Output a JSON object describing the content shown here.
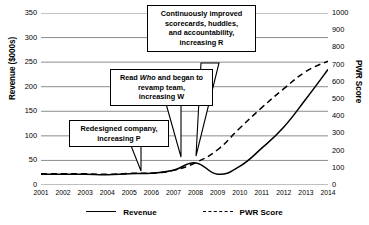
{
  "chart_data": {
    "type": "line",
    "title": "",
    "xlabel": "",
    "ylabel": "Revenue ($000s)",
    "y2label": "PWR Score",
    "grid": true,
    "legend_position": "bottom",
    "categories": [
      2001,
      2002,
      2003,
      2004,
      2005,
      2006,
      2007,
      2008,
      2009,
      2010,
      2011,
      2012,
      2013,
      2014
    ],
    "x_tick_labels": [
      "2001",
      "2002",
      "2003",
      "2004",
      "2005",
      "2006",
      "2007",
      "2008",
      "2009",
      "2010",
      "2011",
      "2012",
      "2013",
      "2014"
    ],
    "ylim": [
      0,
      350
    ],
    "y_tick_labels": [
      "350",
      "300",
      "250",
      "200",
      "150",
      "100",
      "50",
      "0"
    ],
    "y_ticks": [
      350,
      300,
      250,
      200,
      150,
      100,
      50,
      0
    ],
    "y2lim": [
      0,
      1000
    ],
    "y2_tick_labels": [
      "1000",
      "900",
      "800",
      "700",
      "600",
      "500",
      "400",
      "300",
      "200",
      "100",
      "0"
    ],
    "y2_ticks": [
      1000,
      900,
      800,
      700,
      600,
      500,
      400,
      300,
      200,
      100,
      0
    ],
    "series": [
      {
        "name": "Revenue",
        "axis": "left",
        "style": "solid",
        "color": "#000000",
        "values": [
          22,
          22,
          22,
          21,
          23,
          24,
          30,
          45,
          22,
          38,
          75,
          118,
          175,
          235
        ]
      },
      {
        "name": "PWR Score",
        "axis": "right",
        "style": "dashed",
        "color": "#000000",
        "values": [
          65,
          66,
          65,
          62,
          68,
          70,
          85,
          130,
          205,
          330,
          450,
          560,
          660,
          720
        ]
      }
    ],
    "annotations": [
      {
        "id": "increasing-r",
        "text": "Continuously improved scorecards, huddles, and accountability, increasing R",
        "lines": [
          "Continuously improved",
          "scorecards, huddles,",
          "and accountability,",
          "increasing R"
        ],
        "points_to_year": 2010
      },
      {
        "id": "increasing-w",
        "text": "Read Who and began to revamp team, increasing W",
        "lines": [
          "Read Who and began to",
          "revamp team,",
          "increasing W"
        ],
        "italic_word": "Who",
        "points_to_year": 2009
      },
      {
        "id": "increasing-p",
        "text": "Redesigned company, increasing P",
        "lines": [
          "Redesigned company,",
          "increasing P"
        ],
        "points_to_year": 2007
      }
    ]
  },
  "axes": {
    "left_title": "Revenue ($000s)",
    "right_title": "PWR Score"
  },
  "legend": {
    "entries": [
      {
        "label": "Revenue",
        "style": "solid"
      },
      {
        "label": "PWR Score",
        "style": "dashed"
      }
    ]
  },
  "callouts": {
    "r": {
      "line1": "Continuously improved",
      "line2": "scorecards, huddles,",
      "line3": "and accountability,",
      "line4": "increasing R"
    },
    "w": {
      "pre": "Read ",
      "italic": "Who",
      "post": " and began to",
      "line2": "revamp team,",
      "line3": "increasing W"
    },
    "p": {
      "line1": "Redesigned company,",
      "line2": "increasing P"
    }
  }
}
